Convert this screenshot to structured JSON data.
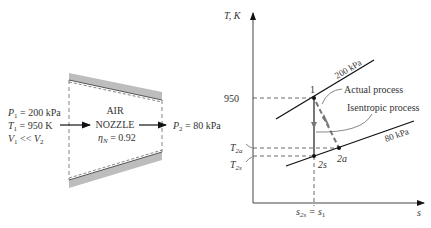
{
  "nozzle": {
    "fluid_label": "AIR",
    "device_label": "NOZZLE",
    "efficiency_label": "η",
    "efficiency_sub": "N",
    "efficiency_value": " = 0.92",
    "inlet": {
      "p_sym": "P",
      "p_sub": "1",
      "p_val": " = 200 kPa",
      "t_sym": "T",
      "t_sub": "1",
      "t_val": " = 950 K",
      "v_sym": "V",
      "v_sub": "1",
      "v_rel": " << ",
      "v2_sym": "V",
      "v2_sub": "2"
    },
    "outlet": {
      "p_sym": "P",
      "p_sub": "2",
      "p_val": " = 80 kPa"
    }
  },
  "ts_diagram": {
    "y_axis_label": "T, K",
    "x_axis_label": "s",
    "tick_950": "950",
    "t2a_sym": "T",
    "t2a_sub": "2a",
    "t2s_sym": "T",
    "t2s_sub": "2s",
    "isobar_high": "200 kPa",
    "isobar_low": "80 kPa",
    "state_1": "1",
    "state_2s": "2s",
    "state_2a": "2a",
    "actual_label": "Actual process",
    "isentropic_label": "Isentropic process",
    "s_label_sym": "s",
    "s_label_sub": "2s",
    "s_label_eq": " = s",
    "s_label_sub2": "1"
  },
  "colors": {
    "line": "#111111",
    "process": "#777777",
    "wall": "#b8b8b8"
  }
}
